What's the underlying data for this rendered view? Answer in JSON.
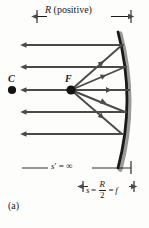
{
  "figure": {
    "panel_label": "(a)",
    "caption_type": "concave-mirror-parallel-rays",
    "labels": {
      "radius_label_symbol": "R",
      "radius_label_text": "(positive)",
      "center_of_curvature": "C",
      "focal_point": "F",
      "image_distance_symbol": "s",
      "image_distance_prime": "′",
      "image_distance_equals": "=",
      "image_distance_value": "∞",
      "object_distance_symbol": "s",
      "focal_eq_first": "=",
      "focal_numerator": "R",
      "focal_denominator": "2",
      "focal_eq_second": "=",
      "focal_symbol": "f"
    },
    "colors": {
      "ink": "#1a1a1a",
      "ray": "#4a4a4a",
      "mirror": "#1a1a1a",
      "mirror_shadow": "#9a9a9a",
      "background": "#fdfdfb"
    },
    "geometry": {
      "mirror_vertex_x": 130,
      "mirror_top_y": 32,
      "mirror_bottom_y": 168,
      "axis_y": 90,
      "center_point_x": 12,
      "focal_point_x": 71,
      "incoming_ray_ys": [
        45,
        67,
        90,
        112,
        134
      ],
      "incoming_ray_left_x": 26,
      "radius_dim_y": 16,
      "radius_dim_x1": 36,
      "radius_dim_x2": 131,
      "sprime_dim_y": 168,
      "sprime_dim_x1": 22,
      "sprime_dim_x2": 131,
      "focal_dim_y": 186,
      "focal_dim_x1": 82,
      "focal_dim_x2": 134
    }
  }
}
